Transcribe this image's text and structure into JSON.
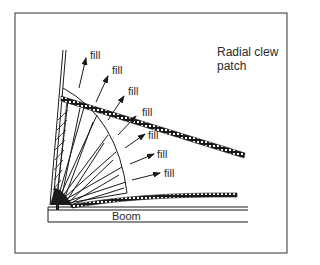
{
  "title": {
    "line1": "Radial clew",
    "line2": "patch"
  },
  "boom_label": "Boom",
  "fill_labels": [
    "fill",
    "fill",
    "fill",
    "fill",
    "fill",
    "fill",
    "fill"
  ],
  "colors": {
    "ink": "#1a1a1a",
    "background": "#ffffff",
    "frame": "#333333"
  }
}
